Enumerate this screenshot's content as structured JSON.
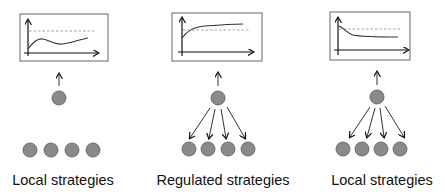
{
  "panels": [
    {
      "id": "local-left",
      "label": "Local strategies",
      "plot": {
        "curve": "wavy - rises, dips, then rises again, stays below dashed reference"
      },
      "central_node": true,
      "downward_arrows": 0,
      "agents": 4
    },
    {
      "id": "regulated",
      "label": "Regulated strategies",
      "plot": {
        "curve": "increasing concave, crosses above dashed reference"
      },
      "central_node": true,
      "downward_arrows": 4,
      "agents": 4
    },
    {
      "id": "local-right",
      "label": "Local strategies",
      "plot": {
        "curve": "decreasing, starts at reference then settles below"
      },
      "central_node": true,
      "downward_arrows": 4,
      "agents": 4
    }
  ],
  "colors": {
    "node_fill": "#8a8a8a",
    "node_stroke": "#5a5a5a",
    "box_stroke": "#666666",
    "reference_line": "#999999",
    "text": "#111111"
  }
}
